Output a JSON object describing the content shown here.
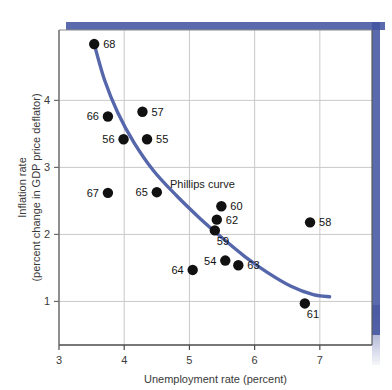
{
  "chart_data": {
    "type": "scatter",
    "title": "",
    "xlabel": "Unemployment rate (percent)",
    "ylabel": "Inflation rate (percent change in GDP price deflator)",
    "ylabel_line1": "Inflation rate",
    "ylabel_line2": "(percent change in GDP price deflator)",
    "xlim": [
      3,
      7.8
    ],
    "ylim": [
      0.35,
      5.05
    ],
    "xticks": [
      3,
      4,
      5,
      6,
      7
    ],
    "xticklabels": [
      "3",
      "4",
      "5",
      "6",
      "7"
    ],
    "yticks": [
      1,
      2,
      3,
      4
    ],
    "yticklabels": [
      "1",
      "2",
      "3",
      "4"
    ],
    "grid": true,
    "annotation": "Phillips curve",
    "curve_color": "#5566aa",
    "point_color": "#111111",
    "frame_shadow_color": "#4455a0",
    "points": [
      {
        "label": "68",
        "x": 3.54,
        "y": 4.84,
        "label_side": "right"
      },
      {
        "label": "66",
        "x": 3.75,
        "y": 3.76,
        "label_side": "left"
      },
      {
        "label": "57",
        "x": 4.28,
        "y": 3.83,
        "label_side": "right"
      },
      {
        "label": "56",
        "x": 3.99,
        "y": 3.42,
        "label_side": "left"
      },
      {
        "label": "55",
        "x": 4.35,
        "y": 3.42,
        "label_side": "right"
      },
      {
        "label": "67",
        "x": 3.75,
        "y": 2.62,
        "label_side": "left"
      },
      {
        "label": "65",
        "x": 4.5,
        "y": 2.63,
        "label_side": "left"
      },
      {
        "label": "60",
        "x": 5.49,
        "y": 2.42,
        "label_side": "right"
      },
      {
        "label": "62",
        "x": 5.42,
        "y": 2.22,
        "label_side": "right"
      },
      {
        "label": "59",
        "x": 5.39,
        "y": 2.06,
        "label_side": "below-right"
      },
      {
        "label": "58",
        "x": 6.85,
        "y": 2.18,
        "label_side": "right"
      },
      {
        "label": "54",
        "x": 5.55,
        "y": 1.61,
        "label_side": "left"
      },
      {
        "label": "63",
        "x": 5.75,
        "y": 1.54,
        "label_side": "right"
      },
      {
        "label": "64",
        "x": 5.05,
        "y": 1.47,
        "label_side": "left"
      },
      {
        "label": "61",
        "x": 6.77,
        "y": 0.97,
        "label_side": "below-right"
      }
    ],
    "curve_points": [
      {
        "x": 3.54,
        "y": 4.84
      },
      {
        "x": 3.7,
        "y": 4.3
      },
      {
        "x": 3.9,
        "y": 3.82
      },
      {
        "x": 4.15,
        "y": 3.37
      },
      {
        "x": 4.45,
        "y": 2.95
      },
      {
        "x": 4.8,
        "y": 2.58
      },
      {
        "x": 5.15,
        "y": 2.25
      },
      {
        "x": 5.5,
        "y": 1.95
      },
      {
        "x": 5.85,
        "y": 1.67
      },
      {
        "x": 6.2,
        "y": 1.43
      },
      {
        "x": 6.55,
        "y": 1.23
      },
      {
        "x": 6.9,
        "y": 1.1
      },
      {
        "x": 7.15,
        "y": 1.07
      }
    ]
  }
}
